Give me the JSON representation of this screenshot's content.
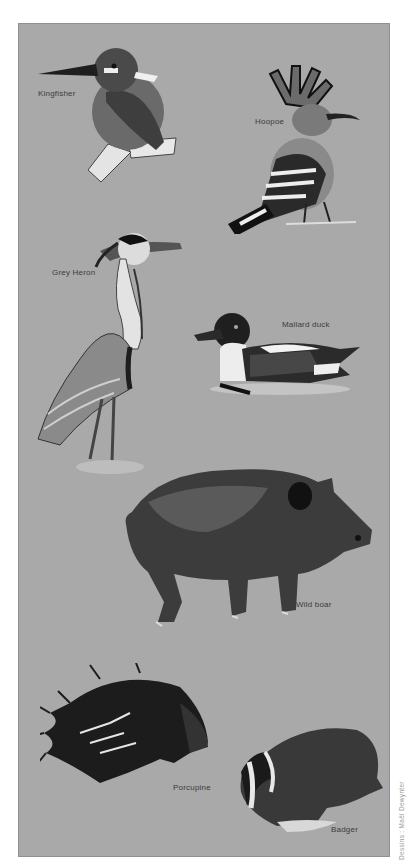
{
  "plate": {
    "background_color": "#a9a9a9",
    "credit": "Dessins : Maël Dewynter"
  },
  "animals": [
    {
      "name": "Kingfisher"
    },
    {
      "name": "Hoopoe"
    },
    {
      "name": "Grey Heron"
    },
    {
      "name": "Mallard duck"
    },
    {
      "name": "Wild boar"
    },
    {
      "name": "Porcupine"
    },
    {
      "name": "Badger"
    }
  ]
}
